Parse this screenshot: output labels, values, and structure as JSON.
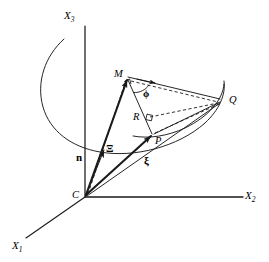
{
  "figure": {
    "background_color": "#ffffff",
    "stroke_color": "#1a1a1a",
    "width": 269,
    "height": 262
  },
  "axes": [
    {
      "id": "x3",
      "label": "X",
      "subscript": "3",
      "direction": "up",
      "from": [
        85,
        197
      ],
      "to": [
        85,
        26
      ]
    },
    {
      "id": "x2",
      "label": "X",
      "subscript": "2",
      "direction": "right",
      "from": [
        85,
        197
      ],
      "to": [
        243,
        197
      ]
    },
    {
      "id": "x1",
      "label": "X",
      "subscript": "1",
      "direction": "down-left",
      "from": [
        85,
        197
      ],
      "to": [
        26,
        238
      ]
    }
  ],
  "points": [
    {
      "id": "C",
      "label": "C",
      "x": 85,
      "y": 197,
      "label_dx": -11,
      "label_dy": -4,
      "marker": "none"
    },
    {
      "id": "M",
      "label": "M",
      "x": 127,
      "y": 77,
      "label_dx": -12,
      "label_dy": -4,
      "marker": "none"
    },
    {
      "id": "R",
      "label": "R",
      "x": 147,
      "y": 120,
      "label_dx": -13,
      "label_dy": -2,
      "marker": "none"
    },
    {
      "id": "P",
      "label": "P",
      "x": 152,
      "y": 135,
      "label_dx": 3,
      "label_dy": 8,
      "marker": "arrowhead"
    },
    {
      "id": "Q",
      "label": "Q",
      "x": 222,
      "y": 101,
      "label_dx": 6,
      "label_dy": 1,
      "marker": "none"
    }
  ],
  "vectors": [
    {
      "id": "n",
      "label": "n",
      "from": "C",
      "to_x": 104,
      "to_y": 149,
      "weight": "thin",
      "label_x": 75,
      "label_y": 153
    },
    {
      "id": "Xi",
      "label": "Ξ",
      "from": "C",
      "to": "M",
      "weight": "thick",
      "label_x": 105,
      "label_y": 147
    },
    {
      "id": "xi",
      "label": "ξ",
      "from": "C",
      "to": "Q",
      "weight": "thick",
      "label_x": 143,
      "label_y": 158
    }
  ],
  "angle": {
    "id": "phi",
    "label": "ϕ",
    "x": 146,
    "y": 95,
    "vertex": "M"
  },
  "segments": [
    {
      "id": "M-Q",
      "from": "M",
      "to": "Q",
      "style": "solid",
      "arrow": "mid"
    },
    {
      "id": "M-P",
      "from": "M",
      "to": "P",
      "style": "solid",
      "arrow": "none"
    },
    {
      "id": "R-Q",
      "from": "R",
      "to": "Q",
      "style": "dashed",
      "arrow": "none"
    },
    {
      "id": "P-Q",
      "from": "P",
      "to": "Q",
      "style": "solid",
      "arrow": "none"
    },
    {
      "id": "P-Qd",
      "from": "P",
      "to": "Q",
      "style": "dashed",
      "arrow": "none"
    },
    {
      "id": "C-M",
      "from": "C",
      "to": "M",
      "style": "dashed",
      "arrow": "none"
    }
  ],
  "right_angles": [
    {
      "id": "at-M",
      "at": "M"
    },
    {
      "id": "at-R",
      "at": "R"
    }
  ],
  "surface": {
    "id": "paraboloid-bowl",
    "description": "open bowl (paraboloid) outline with elliptical rim arc",
    "style": "solid"
  }
}
